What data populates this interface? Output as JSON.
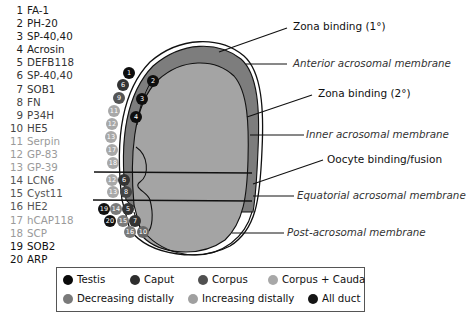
{
  "proteins": [
    {
      "num": "1",
      "name": "FA-1",
      "color": "#1a1a1a"
    },
    {
      "num": "2",
      "name": "PH-20",
      "color": "#1a1a1a"
    },
    {
      "num": "3",
      "name": "SP-40,40",
      "color": "#1a1a1a"
    },
    {
      "num": "4",
      "name": "Acrosin",
      "color": "#1a1a1a"
    },
    {
      "num": "5",
      "name": "DEFB118",
      "color": "#333333"
    },
    {
      "num": "6",
      "name": "SP-40,40",
      "color": "#333333"
    },
    {
      "num": "7",
      "name": "SOB1",
      "color": "#333333"
    },
    {
      "num": "8",
      "name": "FN",
      "color": "#444444"
    },
    {
      "num": "9",
      "name": "P34H",
      "color": "#444444"
    },
    {
      "num": "10",
      "name": "HE5",
      "color": "#444444"
    },
    {
      "num": "11",
      "name": "Serpin",
      "color": "#9a9a9a"
    },
    {
      "num": "12",
      "name": "GP-83",
      "color": "#9a9a9a"
    },
    {
      "num": "13",
      "name": "GP-39",
      "color": "#9a9a9a"
    },
    {
      "num": "14",
      "name": "LCN6",
      "color": "#555555"
    },
    {
      "num": "15",
      "name": "Cyst11",
      "color": "#555555"
    },
    {
      "num": "16",
      "name": "HE2",
      "color": "#555555"
    },
    {
      "num": "17",
      "name": "hCAP118",
      "color": "#9a9a9a"
    },
    {
      "num": "18",
      "name": "SCP",
      "color": "#9a9a9a"
    },
    {
      "num": "19",
      "name": "SOB2",
      "color": "#111111"
    },
    {
      "num": "20",
      "name": "ARP",
      "color": "#111111"
    }
  ],
  "labels": {
    "zona_primary": "Zona binding (1°)",
    "anterior_membrane": "Anterior acrosomal membrane",
    "zona_secondary": "Zona binding (2°)",
    "inner_membrane": "Inner acrosomal membrane",
    "oocyte_fusion": "Oocyte binding/fusion",
    "equatorial_membrane": "Equatorial acrosomal membrane",
    "post_acrosomal_membrane": "Post-acrosomal membrane"
  },
  "legend": [
    {
      "label": "Testis",
      "color": "#0a0a0a"
    },
    {
      "label": "Caput",
      "color": "#2e2e2e"
    },
    {
      "label": "Corpus",
      "color": "#505050"
    },
    {
      "label": "Corpus + Cauda",
      "color": "#a8a8a8"
    },
    {
      "label": "Decreasing distally",
      "color": "#7a7a7a"
    },
    {
      "label": "Increasing distally",
      "color": "#a0a0a0"
    },
    {
      "label": "All duct",
      "color": "#151515"
    }
  ],
  "colors": {
    "acrosome": "#7d7d7d",
    "head": "#a4a4a4",
    "outline": "#111111"
  }
}
